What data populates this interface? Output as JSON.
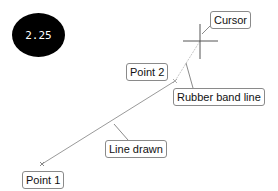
{
  "badge": {
    "text": "2.25"
  },
  "labels": {
    "cursor": "Cursor",
    "point2": "Point 2",
    "rubber_band": "Rubber band line",
    "line_drawn": "Line drawn",
    "point1": "Point 1"
  },
  "colors": {
    "line": "#9a9a9a",
    "rubber_band": "#c8c8c8",
    "cursor": "#555555",
    "leader": "#8a8a8a"
  }
}
